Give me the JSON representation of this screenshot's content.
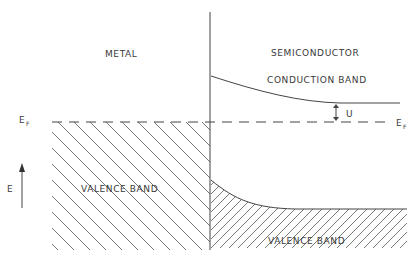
{
  "diagram": {
    "type": "energy-band-diagram",
    "regions": {
      "metal": {
        "label": "METAL",
        "band_label": "VALENCE BAND"
      },
      "semiconductor": {
        "label": "SEMICONDUCTOR",
        "conduction_label": "CONDUCTION BAND",
        "valence_label": "VALENCE BAND"
      }
    },
    "fermi_level": {
      "left_label": "E",
      "left_sub": "F",
      "right_label": "E",
      "right_sub": "F"
    },
    "gap_marker": {
      "label": "U"
    },
    "energy_axis": {
      "label": "E"
    },
    "colors": {
      "line": "#444444",
      "hatch": "#555555",
      "text": "#3a3a3a",
      "background": "#ffffff"
    }
  }
}
